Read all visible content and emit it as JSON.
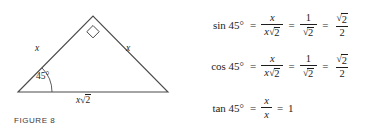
{
  "figure": {
    "caption": "FIGURE 8",
    "angle_label": "45°",
    "left_side_label": "x",
    "right_side_label": "x",
    "base_label_coefficient": "x",
    "base_label_radical_glyph": "√",
    "base_label_radicand": "2",
    "right_angle_marker": "square",
    "stroke_color": "#4a4a4a",
    "vertices": {
      "left": [
        18,
        92
      ],
      "apex": [
        93,
        16
      ],
      "right": [
        168,
        92
      ]
    }
  },
  "equations": {
    "radical_glyph": "√",
    "equals": "=",
    "sin": {
      "function_label": "sin 45°",
      "frac1_num": "x",
      "frac1_den_coefficient": "x",
      "frac1_den_radicand": "2",
      "frac2_num": "1",
      "frac2_den_radicand": "2",
      "frac3_num_radicand": "2",
      "frac3_den": "2"
    },
    "cos": {
      "function_label": "cos 45°",
      "frac1_num": "x",
      "frac1_den_coefficient": "x",
      "frac1_den_radicand": "2",
      "frac2_num": "1",
      "frac2_den_radicand": "2",
      "frac3_num_radicand": "2",
      "frac3_den": "2"
    },
    "tan": {
      "function_label": "tan 45°",
      "frac1_num": "x",
      "frac1_den": "x",
      "result": "1"
    }
  }
}
